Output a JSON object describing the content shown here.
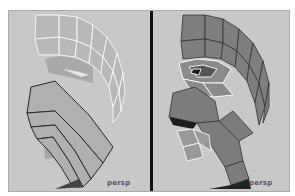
{
  "viewports": [
    {
      "name": "left",
      "camera_label": "persp",
      "mode": "wireframe-on-shaded (faces partially selected)"
    },
    {
      "name": "right",
      "camera_label": "persp",
      "mode": "smooth-shaded with selected edges"
    }
  ],
  "colors": {
    "background": "#c8c8c8",
    "divider": "#111111",
    "mesh_light": "#b4b4b4",
    "mesh_dark": "#7a7a7a",
    "wire_highlight": "#ffffff",
    "wire_dark": "#222222"
  }
}
